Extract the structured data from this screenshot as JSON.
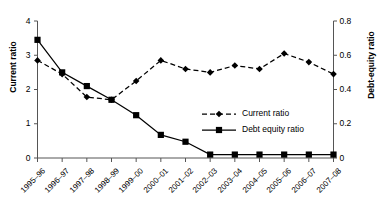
{
  "chart_data": {
    "type": "line",
    "title": "",
    "subtitle": "",
    "xlabel": "",
    "ylabel": "Current ratio",
    "y2label": "Debt-equity ratio",
    "categories": [
      "1995–96",
      "1996–97",
      "1997–98",
      "1998–99",
      "1999–00",
      "2000–01",
      "2001–02",
      "2002–03",
      "2003–04",
      "2004–05",
      "2005–06",
      "2006–07",
      "2007–08"
    ],
    "ylim": [
      0,
      4
    ],
    "yticks": [
      0,
      1,
      2,
      3,
      4
    ],
    "ytick_labels": [
      "0",
      "1",
      "2",
      "3",
      "4"
    ],
    "y2lim": [
      0,
      0.8
    ],
    "y2ticks": [
      0,
      0.2,
      0.4,
      0.6,
      0.8
    ],
    "y2tick_labels": [
      "0",
      "0.2",
      "0.4",
      "0.6",
      "0.8"
    ],
    "grid": false,
    "legend_position": "center-right-inside",
    "series": [
      {
        "name": "Current ratio",
        "axis": "left",
        "marker": "diamond",
        "linestyle": "dashed",
        "color": "#000000",
        "values": [
          2.85,
          2.45,
          1.78,
          1.7,
          2.25,
          2.85,
          2.6,
          2.5,
          2.7,
          2.6,
          3.05,
          2.8,
          2.45
        ]
      },
      {
        "name": "Debt equity ratio",
        "axis": "right",
        "marker": "square",
        "linestyle": "solid",
        "color": "#000000",
        "values": [
          0.69,
          0.5,
          0.42,
          0.34,
          0.25,
          0.135,
          0.095,
          0.02,
          0.02,
          0.02,
          0.02,
          0.02,
          0.02
        ]
      }
    ]
  },
  "legend": {
    "items": [
      {
        "label": "Current ratio",
        "marker": "diamond-icon"
      },
      {
        "label": "Debt equity ratio",
        "marker": "square-icon"
      }
    ]
  },
  "axes": {
    "left_title": "Current ratio",
    "right_title": "Debt-equity ratio"
  }
}
